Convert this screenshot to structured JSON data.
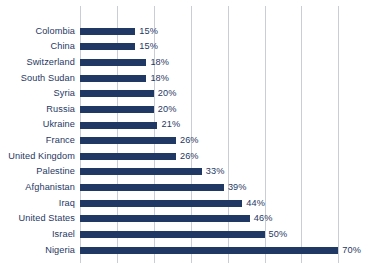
{
  "chart_data": {
    "type": "bar",
    "orientation": "horizontal",
    "title": "",
    "subtitle": "",
    "xlabel": "",
    "ylabel": "",
    "xlim": [
      0,
      80
    ],
    "grid": true,
    "gridline_step": 10,
    "gridline_values": [
      0,
      10,
      20,
      30,
      40,
      50,
      60,
      70
    ],
    "legend": null,
    "value_suffix": "%",
    "bar_color": "#1f3864",
    "label_color": "#1f3864",
    "gridline_color": "#c8cdd8",
    "background_color": "#ffffff",
    "categories": [
      "Colombia",
      "China",
      "Switzerland",
      "South Sudan",
      "Syria",
      "Russia",
      "Ukraine",
      "France",
      "United Kingdom",
      "Palestine",
      "Afghanistan",
      "Iraq",
      "United States",
      "Israel",
      "Nigeria"
    ],
    "values": [
      15,
      15,
      18,
      18,
      20,
      20,
      21,
      26,
      26,
      33,
      39,
      44,
      46,
      50,
      70
    ],
    "value_labels": [
      "15%",
      "15%",
      "18%",
      "18%",
      "20%",
      "20%",
      "21%",
      "26%",
      "26%",
      "33%",
      "39%",
      "44%",
      "46%",
      "50%",
      "70%"
    ]
  }
}
